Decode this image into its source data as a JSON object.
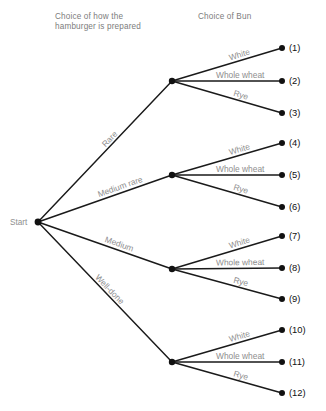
{
  "headers": {
    "stage1": "Choice of how the\nhamburger is prepared",
    "stage1_line1": "Choice of how the",
    "stage1_line2": "hamburger is prepared",
    "stage2": "Choice of Bun"
  },
  "start": {
    "label": "Start"
  },
  "colors": {
    "line": "#1a1a1a",
    "node": "#111111",
    "label": "#8e8e8e",
    "header": "#7c7c7c",
    "outcome": "#111111",
    "background": "#ffffff"
  },
  "chart_data": {
    "type": "diagram",
    "root": "Start",
    "stage1_name": "Choice of how the hamburger is prepared",
    "stage2_name": "Choice of Bun",
    "stage1_options": [
      "Rare",
      "Medium rare",
      "Medium",
      "Well-done"
    ],
    "stage2_options": [
      "White",
      "Whole wheat",
      "Rye"
    ],
    "total_outcomes": 12,
    "outcomes": [
      {
        "id": "(1)",
        "prep": "Rare",
        "bun": "White"
      },
      {
        "id": "(2)",
        "prep": "Rare",
        "bun": "Whole wheat"
      },
      {
        "id": "(3)",
        "prep": "Rare",
        "bun": "Rye"
      },
      {
        "id": "(4)",
        "prep": "Medium rare",
        "bun": "White"
      },
      {
        "id": "(5)",
        "prep": "Medium rare",
        "bun": "Whole wheat"
      },
      {
        "id": "(6)",
        "prep": "Medium rare",
        "bun": "Rye"
      },
      {
        "id": "(7)",
        "prep": "Medium",
        "bun": "White"
      },
      {
        "id": "(8)",
        "prep": "Medium",
        "bun": "Whole wheat"
      },
      {
        "id": "(9)",
        "prep": "Medium",
        "bun": "Rye"
      },
      {
        "id": "(10)",
        "prep": "Well-done",
        "bun": "White"
      },
      {
        "id": "(11)",
        "prep": "Well-done",
        "bun": "Whole wheat"
      },
      {
        "id": "(12)",
        "prep": "Well-done",
        "bun": "Rye"
      }
    ]
  },
  "branches": [
    {
      "prep_label": "Rare",
      "node_y": 81,
      "buns": [
        {
          "label": "White",
          "outcome": "(1)",
          "y": 48
        },
        {
          "label": "Whole wheat",
          "outcome": "(2)",
          "y": 81
        },
        {
          "label": "Rye",
          "outcome": "(3)",
          "y": 113
        }
      ]
    },
    {
      "prep_label": "Medium rare",
      "node_y": 175,
      "buns": [
        {
          "label": "White",
          "outcome": "(4)",
          "y": 143
        },
        {
          "label": "Whole wheat",
          "outcome": "(5)",
          "y": 175
        },
        {
          "label": "Rye",
          "outcome": "(6)",
          "y": 207
        }
      ]
    },
    {
      "prep_label": "Medium",
      "node_y": 269,
      "buns": [
        {
          "label": "White",
          "outcome": "(7)",
          "y": 236
        },
        {
          "label": "Whole wheat",
          "outcome": "(8)",
          "y": 268
        },
        {
          "label": "Rye",
          "outcome": "(9)",
          "y": 299
        }
      ]
    },
    {
      "prep_label": "Well-done",
      "node_y": 362,
      "buns": [
        {
          "label": "White",
          "outcome": "(10)",
          "y": 330
        },
        {
          "label": "Whole wheat",
          "outcome": "(11)",
          "y": 362
        },
        {
          "label": "Rye",
          "outcome": "(12)",
          "y": 393
        }
      ]
    }
  ]
}
